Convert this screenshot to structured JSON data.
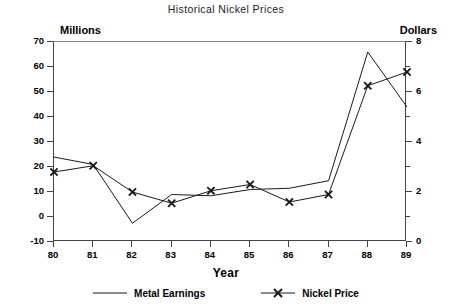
{
  "chart_data": {
    "type": "line",
    "title": "Historical Nickel Prices",
    "xlabel": "Year",
    "ylabel_left": "Millions",
    "ylabel_right": "Dollars",
    "categories": [
      "80",
      "81",
      "82",
      "83",
      "84",
      "85",
      "86",
      "87",
      "88",
      "89"
    ],
    "xlim": [
      80,
      89
    ],
    "ylim_left": [
      -10,
      70
    ],
    "ylim_right": [
      0,
      8
    ],
    "yticks_left": [
      70,
      60,
      50,
      40,
      30,
      20,
      10,
      0,
      -10
    ],
    "yticks_right": [
      8,
      6,
      4,
      2,
      0
    ],
    "grid": false,
    "legend_position": "bottom",
    "series": [
      {
        "name": "Metal Earnings",
        "axis": "left",
        "units": "Millions",
        "marker": "none",
        "values": [
          24,
          21,
          -2.5,
          9,
          8.5,
          11,
          11.5,
          14.5,
          66,
          44
        ]
      },
      {
        "name": "Nickel Price",
        "axis": "right",
        "units": "Dollars",
        "marker": "x",
        "values": [
          2.8,
          3.05,
          2.0,
          1.55,
          2.05,
          2.3,
          1.6,
          1.9,
          6.25,
          6.8
        ]
      }
    ]
  },
  "chart": {
    "title": "Historical Nickel Prices",
    "left_axis_name": "Millions",
    "right_axis_name": "Dollars",
    "x_axis_title": "Year",
    "legend": [
      {
        "label": "Metal Earnings",
        "marker": "line"
      },
      {
        "label": "Nickel Price",
        "marker": "line-x"
      }
    ],
    "colors": {
      "line": "#1a1a1a",
      "axis": "#444444",
      "background": "#ffffff"
    }
  }
}
